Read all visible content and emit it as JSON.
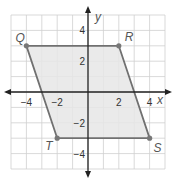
{
  "figure": {
    "type": "coordinate-plane-parallelogram",
    "axes": {
      "x_label": "x",
      "y_label": "y",
      "range": [
        -5,
        5
      ]
    },
    "x_ticks": [
      {
        "value": -4,
        "label": "−4"
      },
      {
        "value": -2,
        "label": "−2"
      },
      {
        "value": 2,
        "label": "2"
      },
      {
        "value": 4,
        "label": "4"
      }
    ],
    "y_ticks": [
      {
        "value": 4,
        "label": "4"
      },
      {
        "value": 2,
        "label": "2"
      },
      {
        "value": -2,
        "label": "−2"
      },
      {
        "value": -4,
        "label": "−4"
      }
    ],
    "vertices": [
      {
        "name": "Q",
        "x": -4,
        "y": 3
      },
      {
        "name": "R",
        "x": 2,
        "y": 3
      },
      {
        "name": "S",
        "x": 4,
        "y": -3
      },
      {
        "name": "T",
        "x": -2,
        "y": -3
      }
    ],
    "colors": {
      "fill": "#e6e6e6",
      "edge": "#707070",
      "grid": "#cfcfcf",
      "axis": "#222222"
    }
  }
}
